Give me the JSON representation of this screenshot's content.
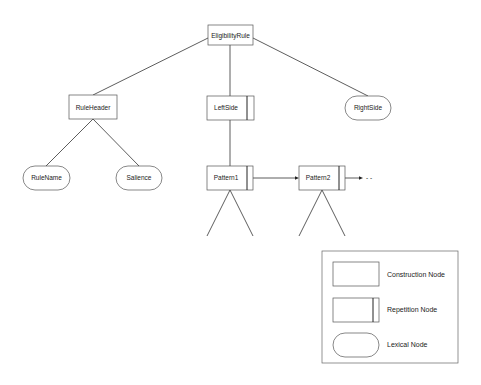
{
  "diagram": {
    "nodes": {
      "root": {
        "label": "EligibilityRule",
        "type": "construction"
      },
      "rule_header": {
        "label": "RuleHeader",
        "type": "construction"
      },
      "left_side": {
        "label": "LeftSide",
        "type": "repetition"
      },
      "right_side": {
        "label": "RightSide",
        "type": "lexical"
      },
      "rule_name": {
        "label": "RuleName",
        "type": "lexical"
      },
      "salience": {
        "label": "Salience",
        "type": "lexical"
      },
      "pattern1": {
        "label": "Pattern1",
        "type": "repetition"
      },
      "pattern2": {
        "label": "Pattern2",
        "type": "repetition"
      }
    },
    "continuation": "- -",
    "legend": {
      "items": [
        {
          "label": "Construction Node",
          "shape": "rectangle"
        },
        {
          "label": "Repetition Node",
          "shape": "rectangle-with-bar"
        },
        {
          "label": "Lexical Node",
          "shape": "rounded"
        }
      ]
    }
  }
}
